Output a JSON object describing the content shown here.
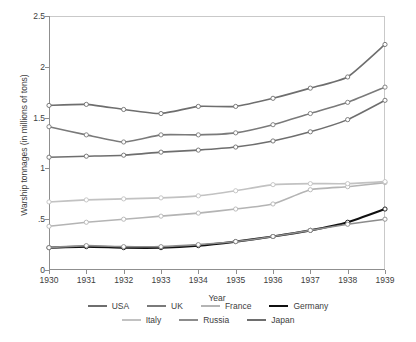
{
  "chart_data": {
    "type": "line",
    "title": "",
    "xlabel": "Year",
    "ylabel": "Warship tonnages (in millions of tons)",
    "x": [
      1930,
      1931,
      1932,
      1933,
      1934,
      1935,
      1936,
      1937,
      1938,
      1939
    ],
    "xtick_labels": [
      "1930",
      "1931",
      "1932",
      "1933",
      "1934",
      "1935",
      "1936",
      "1937",
      "1938",
      "1939"
    ],
    "ytick_labels": [
      "0",
      ".5",
      "1",
      "1.5",
      "2",
      "2.5"
    ],
    "ytick_values": [
      0,
      0.5,
      1,
      1.5,
      2,
      2.5
    ],
    "ylim": [
      0,
      2.5
    ],
    "xlim": [
      1930,
      1939
    ],
    "grid": false,
    "legend_position": "bottom",
    "markers": "open-circle",
    "series": [
      {
        "name": "USA",
        "color": "#6e6e6e",
        "width": 1.6,
        "values": [
          1.62,
          1.63,
          1.58,
          1.54,
          1.61,
          1.61,
          1.69,
          1.79,
          1.9,
          2.22
        ]
      },
      {
        "name": "UK",
        "color": "#7a7a7a",
        "width": 1.6,
        "values": [
          1.41,
          1.33,
          1.26,
          1.33,
          1.33,
          1.35,
          1.43,
          1.54,
          1.65,
          1.8
        ]
      },
      {
        "name": "France",
        "color": "#b4b4b4",
        "width": 1.6,
        "values": [
          0.43,
          0.47,
          0.5,
          0.53,
          0.56,
          0.6,
          0.65,
          0.79,
          0.82,
          0.86
        ]
      },
      {
        "name": "Germany",
        "color": "#101010",
        "width": 2.2,
        "values": [
          0.22,
          0.23,
          0.22,
          0.22,
          0.24,
          0.28,
          0.33,
          0.39,
          0.47,
          0.6
        ]
      },
      {
        "name": "Italy",
        "color": "#c2c2c2",
        "width": 1.6,
        "values": [
          0.67,
          0.69,
          0.7,
          0.71,
          0.73,
          0.78,
          0.84,
          0.85,
          0.85,
          0.87
        ]
      },
      {
        "name": "Russia",
        "color": "#8c8c8c",
        "width": 1.6,
        "values": [
          0.22,
          0.24,
          0.23,
          0.23,
          0.25,
          0.28,
          0.33,
          0.39,
          0.45,
          0.5
        ]
      },
      {
        "name": "Japan",
        "color": "#6e6e6e",
        "width": 1.6,
        "values": [
          1.11,
          1.12,
          1.13,
          1.16,
          1.18,
          1.21,
          1.27,
          1.36,
          1.48,
          1.67
        ]
      }
    ],
    "legend_rows": [
      [
        "USA",
        "UK",
        "France",
        "Germany"
      ],
      [
        "Italy",
        "Russia",
        "Japan"
      ]
    ]
  }
}
